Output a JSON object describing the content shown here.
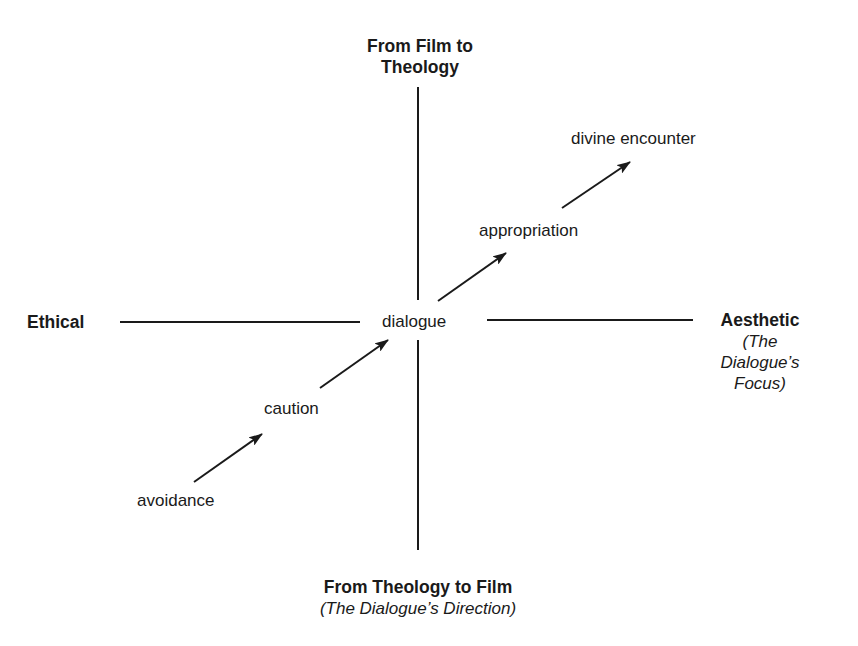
{
  "diagram": {
    "axes": {
      "top": {
        "title_line1": "From Film to",
        "title_line2": "Theology"
      },
      "bottom": {
        "title": "From Theology to Film",
        "subtitle": "(The Dialogue’s Direction)"
      },
      "left": {
        "title": "Ethical"
      },
      "right": {
        "title": "Aesthetic",
        "subtitle_line1": "(The",
        "subtitle_line2": "Dialogue’s",
        "subtitle_line3": "Focus)"
      }
    },
    "nodes": {
      "center": "dialogue",
      "n1": "avoidance",
      "n2": "caution",
      "n3": "appropriation",
      "n4": "divine encounter"
    },
    "arrows": [
      {
        "from": "avoidance",
        "to": "caution"
      },
      {
        "from": "caution",
        "to": "dialogue"
      },
      {
        "from": "dialogue",
        "to": "appropriation"
      },
      {
        "from": "appropriation",
        "to": "divine encounter"
      }
    ],
    "colors": {
      "line": "#1a1a1a",
      "background": "#ffffff"
    }
  }
}
